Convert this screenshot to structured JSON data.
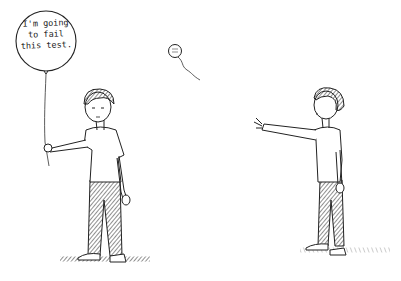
{
  "scene": {
    "type": "comic-panel",
    "background": "#ffffff",
    "ink_color": "#1a1a1a"
  },
  "balloon_large": {
    "lines": [
      "I'm going",
      "to fail",
      "this test."
    ]
  },
  "balloon_small": {
    "lines": [
      "",
      ""
    ]
  },
  "characters": [
    {
      "id": "left-boy",
      "pose": "holding balloon string"
    },
    {
      "id": "right-boy",
      "pose": "reaching toward balloon"
    }
  ]
}
